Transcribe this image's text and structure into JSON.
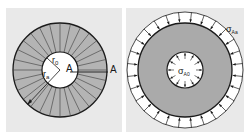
{
  "figure": {
    "left_panel": {
      "title": "Thick-walled cylinder cross-section (radial segments)",
      "labels": {
        "inner_radius": "r",
        "inner_radius_sub": "0",
        "outer_radius": "r",
        "outer_radius_sub": "a",
        "point_inner": "A",
        "point_outer": "A"
      },
      "segment_count": 28
    },
    "right_panel": {
      "title": "Stress distribution with inner and outer pressure",
      "labels": {
        "outer_stress": "σ",
        "outer_stress_sub": "Aa",
        "inner_stress": "σ",
        "inner_stress_sub": "A0"
      },
      "outer_arrow_count": 28,
      "inner_arrow_count": 12
    },
    "colors": {
      "panel_bg": "#e9e9e9",
      "ring_fill": "#b4b4b4",
      "disk_fill": "#aaaaaa",
      "line": "#1a1a1a",
      "white": "#ffffff"
    }
  }
}
